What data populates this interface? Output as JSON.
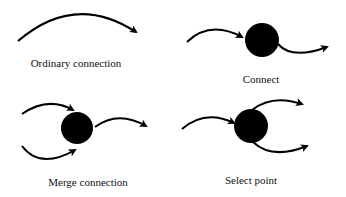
{
  "panels": [
    {
      "id": "ordinary",
      "label": "Ordinary connection",
      "node": false
    },
    {
      "id": "connect",
      "label": "Connect",
      "node": true
    },
    {
      "id": "merge",
      "label": "Merge connection",
      "node": true
    },
    {
      "id": "select",
      "label": "Select point",
      "node": true
    }
  ],
  "colors": {
    "stroke": "#000000",
    "node": "#000000",
    "background": "#ffffff"
  }
}
